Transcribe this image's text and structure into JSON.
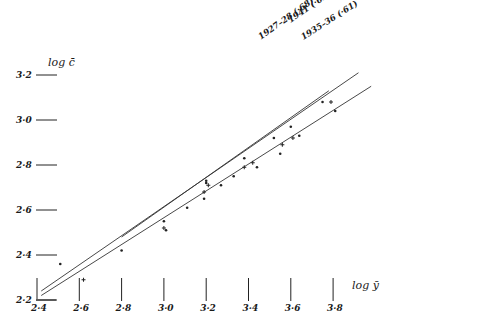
{
  "chart_data": {
    "type": "scatter",
    "title": "",
    "xlabel": "log ȳ",
    "ylabel": "log c̄",
    "xlim": [
      2.4,
      3.9
    ],
    "ylim": [
      2.2,
      3.2
    ],
    "xticks": [
      {
        "value": 2.4,
        "label": "2·4"
      },
      {
        "value": 2.6,
        "label": "2·6"
      },
      {
        "value": 2.8,
        "label": "2·8"
      },
      {
        "value": 3.0,
        "label": "3·0"
      },
      {
        "value": 3.2,
        "label": "3·2"
      },
      {
        "value": 3.4,
        "label": "3·4"
      },
      {
        "value": 3.6,
        "label": "3·6"
      },
      {
        "value": 3.8,
        "label": "3·8"
      }
    ],
    "yticks": [
      {
        "value": 2.2,
        "label": "2·2"
      },
      {
        "value": 2.4,
        "label": "2·4"
      },
      {
        "value": 2.6,
        "label": "2·6"
      },
      {
        "value": 2.8,
        "label": "2·8"
      },
      {
        "value": 3.0,
        "label": "3·0"
      },
      {
        "value": 3.2,
        "label": "3·2"
      }
    ],
    "grid": false,
    "series": [
      {
        "name": "1927–28 (·68)",
        "marker": "dot",
        "line": {
          "x": [
            2.8,
            3.78
          ],
          "y": [
            2.48,
            3.13
          ]
        },
        "points": [
          {
            "x": 3.0,
            "y": 2.55
          },
          {
            "x": 3.2,
            "y": 2.72
          },
          {
            "x": 3.2,
            "y": 2.73
          },
          {
            "x": 3.38,
            "y": 2.83
          },
          {
            "x": 3.52,
            "y": 2.92
          },
          {
            "x": 3.6,
            "y": 2.97
          },
          {
            "x": 3.75,
            "y": 3.08
          }
        ]
      },
      {
        "name": "1941 (·65)",
        "marker": "cross",
        "line": {
          "x": [
            2.42,
            3.92
          ],
          "y": [
            2.24,
            3.21
          ]
        },
        "points": [
          {
            "x": 2.62,
            "y": 2.29
          },
          {
            "x": 3.0,
            "y": 2.52
          },
          {
            "x": 3.19,
            "y": 2.68
          },
          {
            "x": 3.21,
            "y": 2.71
          },
          {
            "x": 3.38,
            "y": 2.79
          },
          {
            "x": 3.42,
            "y": 2.81
          },
          {
            "x": 3.56,
            "y": 2.89
          },
          {
            "x": 3.61,
            "y": 2.92
          },
          {
            "x": 3.79,
            "y": 3.08
          }
        ]
      },
      {
        "name": "1935–36 (·61)",
        "marker": "dot",
        "line": {
          "x": [
            2.42,
            3.98
          ],
          "y": [
            2.22,
            3.15
          ]
        },
        "points": [
          {
            "x": 2.51,
            "y": 2.36
          },
          {
            "x": 2.8,
            "y": 2.42
          },
          {
            "x": 3.01,
            "y": 2.51
          },
          {
            "x": 3.11,
            "y": 2.61
          },
          {
            "x": 3.19,
            "y": 2.65
          },
          {
            "x": 3.27,
            "y": 2.71
          },
          {
            "x": 3.33,
            "y": 2.75
          },
          {
            "x": 3.44,
            "y": 2.79
          },
          {
            "x": 3.55,
            "y": 2.85
          },
          {
            "x": 3.64,
            "y": 2.93
          },
          {
            "x": 3.81,
            "y": 3.04
          }
        ]
      }
    ]
  }
}
